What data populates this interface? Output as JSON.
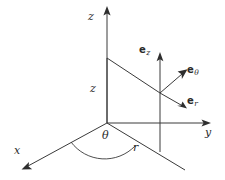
{
  "figure": {
    "background_color": "#ffffff",
    "line_color": "#3a3a3a",
    "text_color": "#2b2b2b"
  },
  "axes": {
    "z": {
      "label": "z",
      "arrow_tip": [
        107,
        8
      ],
      "origin": [
        107,
        123
      ]
    },
    "y": {
      "label": "y",
      "arrow_tip": [
        210,
        123
      ],
      "origin": [
        107,
        123
      ]
    },
    "x": {
      "label": "x",
      "arrow_tip": [
        23,
        170
      ],
      "origin": [
        107,
        123
      ]
    }
  },
  "measures": {
    "height_z": {
      "label": "z"
    },
    "radius_r": {
      "label": "r"
    },
    "angle_theta": {
      "label": "θ"
    }
  },
  "unit_vectors": [
    {
      "name": "e-z",
      "base": "e",
      "subscript": "z",
      "label": "e_z"
    },
    {
      "name": "e-theta",
      "base": "e",
      "subscript": "θ",
      "label": "e_theta"
    },
    {
      "name": "e-r",
      "base": "e",
      "subscript": "r",
      "label": "e_r"
    }
  ],
  "point": {
    "location": [
      160,
      93
    ]
  }
}
